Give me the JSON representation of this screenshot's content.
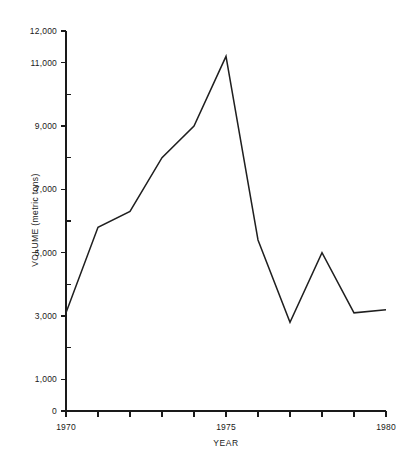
{
  "chart_data": {
    "type": "line",
    "title": "",
    "subtitle": "",
    "xlabel": "YEAR",
    "ylabel": "VOLUME (metric tons)",
    "x": [
      1970,
      1971,
      1972,
      1973,
      1974,
      1975,
      1976,
      1977,
      1978,
      1979,
      1980
    ],
    "values": [
      3100,
      5800,
      6300,
      8000,
      9000,
      11200,
      5400,
      2800,
      5000,
      3100,
      3200
    ],
    "series": [
      {
        "name": "Volume",
        "values": [
          3100,
          5800,
          6300,
          8000,
          9000,
          11200,
          5400,
          2800,
          5000,
          3100,
          3200
        ]
      }
    ],
    "xlim": [
      1970,
      1980
    ],
    "ylim": [
      0,
      12000
    ],
    "xtick_values": [
      1970,
      1971,
      1972,
      1973,
      1974,
      1975,
      1976,
      1977,
      1978,
      1979,
      1980
    ],
    "xtick_labels_visible": [
      "1970",
      "1975",
      "1980"
    ],
    "xtick_labeled_values": [
      1970,
      1975,
      1980
    ],
    "ytick_values": [
      0,
      1000,
      2000,
      3000,
      4000,
      5000,
      6000,
      7000,
      8000,
      9000,
      10000,
      11000,
      12000
    ],
    "ytick_labels_visible": [
      "0",
      "1,000",
      "3,000",
      "5,000",
      "7,000",
      "9,000",
      "11,000",
      "12,000"
    ],
    "ytick_labeled_values": [
      0,
      1000,
      3000,
      5000,
      7000,
      9000,
      11000,
      12000
    ],
    "grid": false,
    "legend": null,
    "legend_position": "none",
    "line_color": "#1f1f1f",
    "background_color": "#ffffff",
    "axis_color": "#1a1a1a",
    "annotations": []
  },
  "axis": {
    "y_title": "VOLUME (metric tons)",
    "x_title": "YEAR",
    "y_labels": [
      {
        "value": 12000,
        "text": "12,000"
      },
      {
        "value": 11000,
        "text": "11,000"
      },
      {
        "value": 9000,
        "text": "9,000"
      },
      {
        "value": 7000,
        "text": "7,000"
      },
      {
        "value": 5000,
        "text": "5,000"
      },
      {
        "value": 3000,
        "text": "3,000"
      },
      {
        "value": 1000,
        "text": "1,000"
      },
      {
        "value": 0,
        "text": "0"
      }
    ],
    "x_labels": [
      {
        "value": 1970,
        "text": "1970"
      },
      {
        "value": 1975,
        "text": "1975"
      },
      {
        "value": 1980,
        "text": "1980"
      }
    ]
  }
}
